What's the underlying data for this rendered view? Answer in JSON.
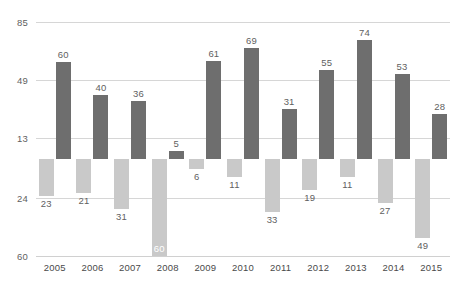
{
  "chart_data": {
    "type": "bar",
    "title": "",
    "subtitle": "",
    "xlabel": "",
    "ylabel": "",
    "categories": [
      "2005",
      "2006",
      "2007",
      "2008",
      "2009",
      "2010",
      "2011",
      "2012",
      "2013",
      "2014",
      "2015"
    ],
    "series": [
      {
        "name": "positive",
        "color": "#6e6e6e",
        "values": [
          60,
          40,
          36,
          5,
          61,
          69,
          31,
          55,
          74,
          53,
          28
        ]
      },
      {
        "name": "negative",
        "color": "#c9c9c9",
        "values": [
          -23,
          -21,
          -31,
          -60,
          -6,
          -11,
          -33,
          -19,
          -11,
          -27,
          -49
        ]
      }
    ],
    "positive_labels": [
      "60",
      "40",
      "36",
      "5",
      "61",
      "69",
      "31",
      "55",
      "74",
      "53",
      "28"
    ],
    "negative_labels": [
      "23",
      "21",
      "31",
      "60",
      "6",
      "11",
      "33",
      "19",
      "11",
      "27",
      "49"
    ],
    "ylim": [
      -60,
      85
    ],
    "yticks": [
      85,
      49,
      13,
      -24,
      -60
    ],
    "ytick_labels": [
      "85",
      "49",
      "13",
      "24",
      "60"
    ],
    "grid": true,
    "legend": "none",
    "baseline": 0,
    "colors": {
      "positive_bar": "#6e6e6e",
      "negative_bar": "#c9c9c9",
      "gridline": "#d6d6d6",
      "axis_text": "#5f5f5f",
      "category_text": "#4a4a4a",
      "background": "#ffffff"
    }
  }
}
